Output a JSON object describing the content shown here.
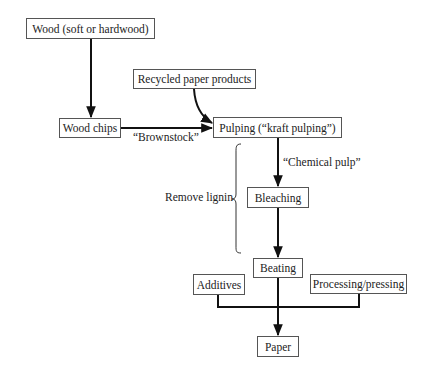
{
  "diagram": {
    "type": "flowchart",
    "title": "",
    "nodes": {
      "wood": "Wood (soft or hardwood)",
      "recycled": "Recycled paper products",
      "wood_chips": "Wood chips",
      "pulping": "Pulping (“kraft pulping”)",
      "bleaching": "Bleaching",
      "beating": "Beating",
      "additives": "Additives",
      "processing": "Processing/pressing",
      "paper": "Paper"
    },
    "edge_labels": {
      "brownstock": "“Brownstock”",
      "chemical_pulp": "“Chemical pulp”"
    },
    "annotations": {
      "remove_lignin": "Remove lignin"
    },
    "edges": [
      {
        "from": "wood",
        "to": "wood_chips"
      },
      {
        "from": "wood_chips",
        "to": "pulping",
        "label": "“Brownstock”"
      },
      {
        "from": "recycled",
        "to": "pulping"
      },
      {
        "from": "pulping",
        "to": "bleaching",
        "label": "“Chemical pulp”"
      },
      {
        "from": "bleaching",
        "to": "beating"
      },
      {
        "from": "beating",
        "to": "paper"
      },
      {
        "from": "additives",
        "to": "paper"
      },
      {
        "from": "processing",
        "to": "paper"
      }
    ]
  }
}
